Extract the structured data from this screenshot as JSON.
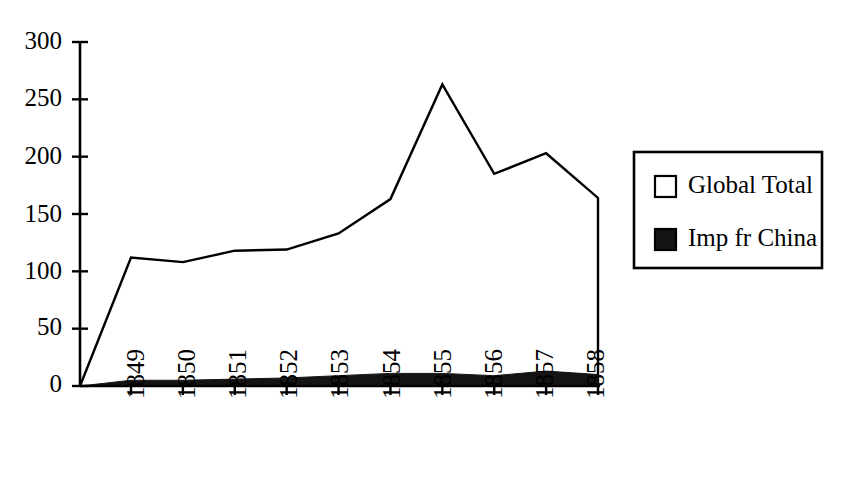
{
  "chart_data": {
    "type": "area",
    "title": "",
    "subtitle": "",
    "xlabel": "",
    "ylabel": "",
    "categories": [
      "1849",
      "1850",
      "1851",
      "1852",
      "1853",
      "1854",
      "1855",
      "1856",
      "1857",
      "1858"
    ],
    "series": [
      {
        "name": "Global Total",
        "fill": "#ffffff",
        "values": [
          112,
          108,
          118,
          119,
          133,
          163,
          263,
          185,
          203,
          164
        ]
      },
      {
        "name": "Imp fr China",
        "fill": "#141414",
        "values": [
          5,
          5,
          6,
          7,
          9,
          11,
          11,
          9,
          13,
          10
        ]
      }
    ],
    "origin_value": 0,
    "ylim": [
      0,
      300
    ],
    "yticks": [
      0,
      50,
      100,
      150,
      200,
      250,
      300
    ],
    "ytick_labels": [
      "0",
      "50",
      "100",
      "150",
      "200",
      "250",
      "300"
    ],
    "xtick_labels": [
      "1849",
      "1850",
      "1851",
      "1852",
      "1853",
      "1854",
      "1855",
      "1856",
      "1857",
      "1858"
    ],
    "xtick_rotation": -90,
    "grid": false,
    "legend_position": "right",
    "legend_entries": [
      {
        "label": "Global Total",
        "swatch": "open-square",
        "color": "#ffffff"
      },
      {
        "label": "Imp fr China",
        "swatch": "filled-square",
        "color": "#141414"
      }
    ]
  },
  "axes": {
    "y_axis_name": "y-axis",
    "x_axis_name": "x-axis"
  },
  "legend": {
    "entry0_label": "Global Total",
    "entry1_label": "Imp fr China"
  },
  "ytick0": "0",
  "ytick1": "50",
  "ytick2": "100",
  "ytick3": "150",
  "ytick4": "200",
  "ytick5": "250",
  "ytick6": "300",
  "xtick0": "1849",
  "xtick1": "1850",
  "xtick2": "1851",
  "xtick3": "1852",
  "xtick4": "1853",
  "xtick5": "1854",
  "xtick6": "1855",
  "xtick7": "1856",
  "xtick8": "1857",
  "xtick9": "1858"
}
